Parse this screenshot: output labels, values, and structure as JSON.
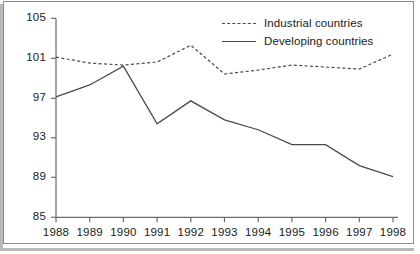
{
  "chart_data": {
    "type": "line",
    "title": "",
    "subtitle": "",
    "xlabel": "",
    "ylabel": "",
    "x": [
      1988,
      1989,
      1990,
      1991,
      1992,
      1993,
      1994,
      1995,
      1996,
      1997,
      1998
    ],
    "categories": [
      "1988",
      "1989",
      "1990",
      "1991",
      "1992",
      "1993",
      "1994",
      "1995",
      "1996",
      "1997",
      "1998"
    ],
    "series": [
      {
        "name": "Industrial countries",
        "style": "dashed",
        "color": "#4a4a4a",
        "values": [
          101.1,
          100.5,
          100.3,
          100.6,
          102.3,
          99.4,
          99.8,
          100.3,
          100.1,
          99.9,
          101.4
        ]
      },
      {
        "name": "Developing countries",
        "style": "solid",
        "color": "#4a4a4a",
        "values": [
          97.1,
          98.3,
          100.2,
          94.4,
          96.7,
          94.8,
          93.8,
          92.3,
          92.3,
          90.2,
          89.1
        ]
      }
    ],
    "ylim": [
      85,
      105
    ],
    "yticks": [
      85,
      89,
      93,
      97,
      101,
      105
    ],
    "ytick_labels": [
      "85",
      "89",
      "93",
      "97",
      "101",
      "105"
    ],
    "xlim": [
      1988,
      1998
    ],
    "xticks": [
      1988,
      1989,
      1990,
      1991,
      1992,
      1993,
      1994,
      1995,
      1996,
      1997,
      1998
    ],
    "grid": false,
    "legend_position": "top-right",
    "axis_color": "#6b6b6b",
    "background": "#ffffff"
  },
  "legend": {
    "items": [
      {
        "label": "Industrial countries",
        "key": "dashed-line-key"
      },
      {
        "label": "Developing countries",
        "key": "solid-line-key"
      }
    ]
  },
  "axes": {
    "y_labels": [
      "105",
      "101",
      "97",
      "93",
      "89",
      "85"
    ],
    "x_labels": [
      "1988",
      "1989",
      "1990",
      "1991",
      "1992",
      "1993",
      "1994",
      "1995",
      "1996",
      "1997",
      "1998"
    ]
  }
}
